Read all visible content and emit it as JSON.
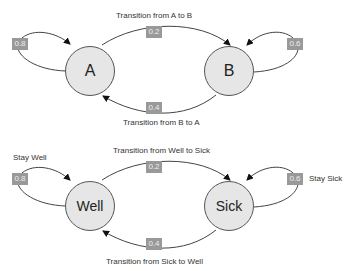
{
  "diagrams": [
    {
      "nodes": [
        {
          "id": "A",
          "label": "A"
        },
        {
          "id": "B",
          "label": "B"
        }
      ],
      "edges": [
        {
          "from": "A",
          "to": "A",
          "prob": "0.8",
          "label": ""
        },
        {
          "from": "A",
          "to": "B",
          "prob": "0.2",
          "label": "Transition from A to B"
        },
        {
          "from": "B",
          "to": "B",
          "prob": "0.6",
          "label": ""
        },
        {
          "from": "B",
          "to": "A",
          "prob": "0.4",
          "label": "Transition from B to A"
        }
      ]
    },
    {
      "nodes": [
        {
          "id": "Well",
          "label": "Well"
        },
        {
          "id": "Sick",
          "label": "Sick"
        }
      ],
      "edges": [
        {
          "from": "Well",
          "to": "Well",
          "prob": "0.8",
          "label": "Stay Well"
        },
        {
          "from": "Well",
          "to": "Sick",
          "prob": "0.2",
          "label": "Transition from Well to Sick"
        },
        {
          "from": "Sick",
          "to": "Sick",
          "prob": "0.6",
          "label": "Stay Sick"
        },
        {
          "from": "Sick",
          "to": "Well",
          "prob": "0.4",
          "label": "Transition from Sick to Well"
        }
      ]
    }
  ]
}
